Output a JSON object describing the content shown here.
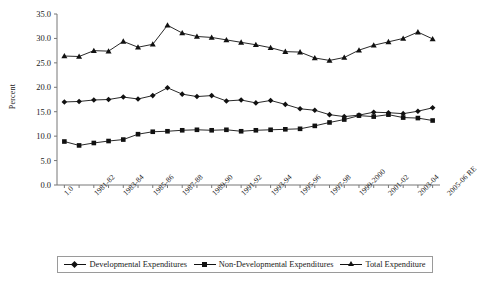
{
  "chart_data": {
    "type": "line",
    "title": "",
    "xlabel": "",
    "ylabel": "Percent",
    "ylim": [
      0.0,
      35.0
    ],
    "yticks": [
      "0.0",
      "5.0",
      "10.0",
      "15.0",
      "20.0",
      "25.0",
      "30.0",
      "35.0"
    ],
    "grid": false,
    "legend_position": "bottom",
    "x": [
      "1.0",
      "1981-82",
      "1982-83",
      "1983-84",
      "1984-85",
      "1985-86",
      "1986-87",
      "1987-88",
      "1988-89",
      "1989-90",
      "1990-91",
      "1991-92",
      "1992-93",
      "1993-94",
      "1994-95",
      "1995-96",
      "1996-97",
      "1997-98",
      "1998-99",
      "1999-2000",
      "2000-01",
      "2001-02",
      "2002-03",
      "2003-04",
      "2004-05",
      "2005-06 RE"
    ],
    "xtick_labels": [
      "1.0",
      "1981-82",
      "1983-84",
      "1985-86",
      "1987-88",
      "1989-90",
      "1991-92",
      "1993-94",
      "1995-96",
      "1997-98",
      "1999-2000",
      "2001-02",
      "2003-04",
      "2005-06 RE"
    ],
    "series": [
      {
        "name": "Developmental Expenditures",
        "marker": "diamond",
        "values": [
          17.0,
          17.1,
          17.4,
          17.5,
          18.0,
          17.6,
          18.3,
          19.9,
          18.6,
          18.1,
          18.3,
          17.2,
          17.4,
          16.8,
          17.3,
          16.5,
          15.6,
          15.3,
          14.4,
          14.0,
          14.3,
          14.9,
          14.8,
          14.6,
          15.1,
          15.8
        ]
      },
      {
        "name": "Non-Developmental Expenditures",
        "marker": "square",
        "values": [
          8.9,
          8.1,
          8.6,
          9.0,
          9.3,
          10.4,
          10.9,
          11.0,
          11.2,
          11.3,
          11.2,
          11.3,
          11.0,
          11.2,
          11.3,
          11.4,
          11.5,
          12.1,
          12.8,
          13.4,
          14.2,
          14.0,
          14.4,
          13.8,
          13.7,
          13.2
        ]
      },
      {
        "name": "Total Expenditure",
        "marker": "triangle",
        "values": [
          26.4,
          26.3,
          27.5,
          27.4,
          29.4,
          28.2,
          28.8,
          32.7,
          31.1,
          30.4,
          30.2,
          29.7,
          29.2,
          28.7,
          28.1,
          27.3,
          27.2,
          26.0,
          25.5,
          26.1,
          27.6,
          28.6,
          29.3,
          30.0,
          31.3,
          29.9
        ]
      }
    ]
  },
  "legend": {
    "items": [
      {
        "label": "Developmental Expenditures"
      },
      {
        "label": "Non-Developmental Expenditures"
      },
      {
        "label": "Total Expenditure"
      }
    ]
  },
  "colors": {
    "line": "#111111",
    "axis": "#777777",
    "text": "#1a1a1a"
  }
}
